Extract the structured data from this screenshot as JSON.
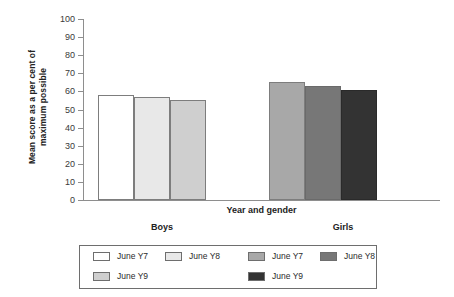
{
  "chart_data": {
    "type": "bar",
    "title": "",
    "xlabel": "Year and gender",
    "ylabel": "Mean score as a per cent of maximum possible",
    "ylabel_lines": [
      "Mean score as a per cent of",
      "maximum possible"
    ],
    "ylim": [
      0,
      100
    ],
    "ytick_labels": [
      "100",
      "90",
      "80",
      "70",
      "60",
      "50",
      "40",
      "30",
      "20",
      "10",
      "0"
    ],
    "ytick_values": [
      100,
      90,
      80,
      70,
      60,
      50,
      40,
      30,
      20,
      10,
      0
    ],
    "grid": false,
    "legend_position": "bottom",
    "group_labels": [
      "Boys",
      "Girls"
    ],
    "categories": [
      "Boys June Y7",
      "Boys June Y8",
      "Boys June Y9",
      "Girls June Y7",
      "Girls June Y8",
      "Girls June Y9"
    ],
    "values": [
      58,
      57,
      55,
      65,
      63,
      61
    ],
    "bars": [
      {
        "group": "Boys",
        "series": "June Y7",
        "value": 58,
        "color": "#ffffff",
        "border": "#7d7d7d"
      },
      {
        "group": "Boys",
        "series": "June Y8",
        "value": 57,
        "color": "#e8e8e8",
        "border": "#7d7d7d"
      },
      {
        "group": "Boys",
        "series": "June Y9",
        "value": 55,
        "color": "#cfcfcf",
        "border": "#7d7d7d"
      },
      {
        "group": "Girls",
        "series": "June Y7",
        "value": 65,
        "color": "#a8a8a8",
        "border": "#7d7d7d"
      },
      {
        "group": "Girls",
        "series": "June Y8",
        "value": 63,
        "color": "#777777",
        "border": "#6a6a6a"
      },
      {
        "group": "Girls",
        "series": "June Y9",
        "value": 61,
        "color": "#333333",
        "border": "#2a2a2a"
      }
    ],
    "legend": [
      {
        "label": "June Y7",
        "color": "#ffffff"
      },
      {
        "label": "June Y8",
        "color": "#e8e8e8"
      },
      {
        "label": "June Y7",
        "color": "#a8a8a8"
      },
      {
        "label": "June Y8",
        "color": "#777777"
      },
      {
        "label": "June Y9",
        "color": "#cfcfcf"
      },
      {
        "label": "June Y9",
        "color": "#333333"
      }
    ]
  },
  "colors": {
    "axis": "#8e8e8e",
    "text": "#2b2b2b",
    "legend_border": "#6e6e6e",
    "background": "#ffffff"
  }
}
